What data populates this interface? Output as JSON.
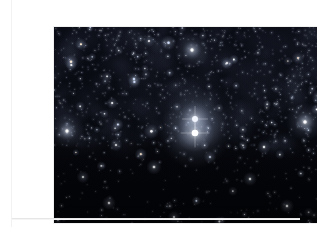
{
  "page": {
    "background_color": "#ffffff",
    "width": 317,
    "height": 227
  },
  "figure": {
    "name": "star-field-photograph",
    "frame": {
      "x": 14,
      "y": 11,
      "width": 285,
      "height": 196
    },
    "sky_color": "#05060b",
    "sky_color_secondary": "#0b0d16",
    "star_color": "#ffffff",
    "star_color_cool": "#cfe0ff",
    "star_color_warm": "#ffe9cf"
  },
  "divider": {
    "name": "horizontal-rule",
    "color": "#e6e6e6",
    "y": 218
  },
  "chart_data": {
    "type": "scatter",
    "title": "",
    "xlabel": "",
    "ylabel": "",
    "xlim": [
      0,
      285
    ],
    "ylim": [
      0,
      196
    ],
    "grid": false,
    "legend": null,
    "background": "#05060b",
    "bright_stars": [
      {
        "x": 141,
        "y": 92,
        "r": 5.4,
        "b": 1.0,
        "t": "w",
        "label": "primary-bright-star"
      },
      {
        "x": 141,
        "y": 106,
        "r": 6.0,
        "b": 1.0,
        "t": "w",
        "label": "secondary-bright-star"
      },
      {
        "x": 138,
        "y": 23,
        "r": 3.0,
        "b": 0.95,
        "t": "w",
        "label": "upper-bright-star"
      },
      {
        "x": 251,
        "y": 95,
        "r": 3.2,
        "b": 0.95,
        "t": "w",
        "label": "right-bright-star"
      },
      {
        "x": 13,
        "y": 104,
        "r": 3.0,
        "b": 0.92,
        "t": "w",
        "label": "left-bright-star"
      },
      {
        "x": 265,
        "y": 70,
        "r": 2.4,
        "b": 0.88,
        "t": "c"
      },
      {
        "x": 100,
        "y": 140,
        "r": 2.4,
        "b": 0.85,
        "t": "w"
      },
      {
        "x": 196,
        "y": 152,
        "r": 2.2,
        "b": 0.84,
        "t": "w"
      },
      {
        "x": 55,
        "y": 176,
        "r": 2.2,
        "b": 0.82,
        "t": "w"
      },
      {
        "x": 233,
        "y": 179,
        "r": 2.2,
        "b": 0.82,
        "t": "w"
      },
      {
        "x": 80,
        "y": 52,
        "r": 2.2,
        "b": 0.86,
        "t": "c"
      },
      {
        "x": 173,
        "y": 36,
        "r": 2.0,
        "b": 0.84,
        "t": "w"
      },
      {
        "x": 210,
        "y": 120,
        "r": 2.2,
        "b": 0.84,
        "t": "w"
      },
      {
        "x": 29,
        "y": 150,
        "r": 2.0,
        "b": 0.8,
        "t": "w"
      },
      {
        "x": 120,
        "y": 190,
        "r": 2.0,
        "b": 0.78,
        "t": "w"
      },
      {
        "x": 244,
        "y": 31,
        "r": 2.0,
        "b": 0.8,
        "t": "m"
      },
      {
        "x": 62,
        "y": 118,
        "r": 2.0,
        "b": 0.8,
        "t": "w"
      },
      {
        "x": 156,
        "y": 130,
        "r": 2.0,
        "b": 0.8,
        "t": "c"
      },
      {
        "x": 274,
        "y": 160,
        "r": 1.9,
        "b": 0.76,
        "t": "w"
      },
      {
        "x": 95,
        "y": 14,
        "r": 1.9,
        "b": 0.78,
        "t": "w"
      }
    ],
    "field_density": {
      "upper_band_rows": 120,
      "lower_band_rows": 70,
      "upper_band_density": "high",
      "lower_band_density": "low",
      "total_estimated_stars": 1400
    }
  }
}
